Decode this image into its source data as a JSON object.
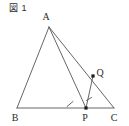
{
  "figure": {
    "caption": "図 1",
    "type": "geometry-diagram",
    "background_color": "#ffffff",
    "stroke_color": "#555555",
    "label_color": "#2b2b2b"
  },
  "points": [
    {
      "name": "A",
      "label": "A",
      "x": 49,
      "y": 27,
      "label_x": 46,
      "label_y": 20,
      "marker": "none"
    },
    {
      "name": "B",
      "label": "B",
      "x": 17,
      "y": 108,
      "label_x": 13,
      "label_y": 120,
      "marker": "none"
    },
    {
      "name": "C",
      "label": "C",
      "x": 114,
      "y": 108,
      "label_x": 112,
      "label_y": 120,
      "marker": "none"
    },
    {
      "name": "P",
      "label": "P",
      "x": 86,
      "y": 108,
      "label_x": 83,
      "label_y": 120,
      "marker": "dot"
    },
    {
      "name": "Q",
      "label": "Q",
      "x": 93,
      "y": 76,
      "label_x": 98,
      "label_y": 74,
      "marker": "dot"
    }
  ],
  "segments": [
    {
      "name": "AB",
      "from": "A",
      "to": "B"
    },
    {
      "name": "BC",
      "from": "B",
      "to": "C"
    },
    {
      "name": "AP",
      "from": "A",
      "to": "P"
    },
    {
      "name": "AC",
      "from": "A",
      "to": "C"
    },
    {
      "name": "PQ",
      "from": "P",
      "to": "Q"
    }
  ],
  "marks": [
    {
      "name": "tick-on-BP",
      "segment": "BP",
      "x": 70,
      "y": 104,
      "kind": "single-tick"
    },
    {
      "name": "tick-on-PQ",
      "segment": "PQ",
      "x": 89,
      "y": 99,
      "kind": "single-tick"
    }
  ]
}
